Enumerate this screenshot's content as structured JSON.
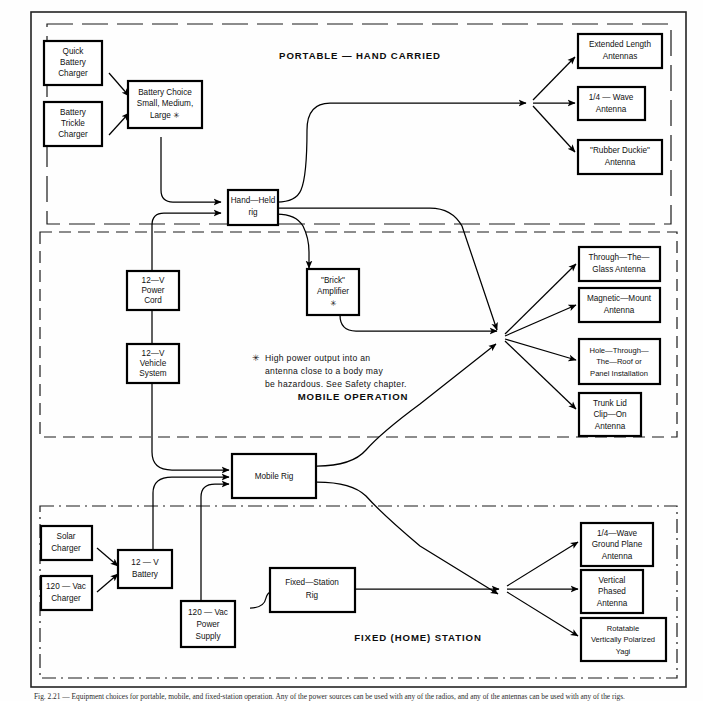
{
  "figure": {
    "caption": "Fig. 2.21 — Equipment choices for portable, mobile, and fixed-station operation. Any of the power sources can be used with any of the radios, and any of the antennas can be used with any of the rigs."
  },
  "sections": [
    {
      "id": "portable",
      "title": "PORTABLE — HAND CARRIED",
      "border_style": "long-dash"
    },
    {
      "id": "mobile",
      "title": "MOBILE OPERATION",
      "border_style": "dashed"
    },
    {
      "id": "fixed",
      "title": "FIXED (HOME) STATION",
      "border_style": "dash-dot"
    }
  ],
  "note": {
    "symbol": "✳",
    "lines": [
      "High power output into an",
      "antenna close to a body may",
      "be hazardous. See Safety chapter."
    ]
  },
  "nodes": {
    "quick_battery_charger": {
      "lines": [
        "Quick",
        "Battery",
        "Charger"
      ]
    },
    "battery_trickle_charger": {
      "lines": [
        "Battery",
        "Trickle",
        "Charger"
      ]
    },
    "battery_choice": {
      "lines": [
        "Battery Choice",
        "Small, Medium,",
        "Large ✳"
      ]
    },
    "hand_held_rig": {
      "lines": [
        "Hand—Held",
        "rig"
      ]
    },
    "extended_length_antennas": {
      "lines": [
        "Extended Length",
        "Antennas"
      ]
    },
    "quarter_wave_antenna": {
      "lines": [
        "1/4 — Wave",
        "Antenna"
      ]
    },
    "rubber_duckie_antenna": {
      "lines": [
        "\"Rubber Duckie\"",
        "Antenna"
      ]
    },
    "power_cord_12v": {
      "lines": [
        "12—V",
        "Power",
        "Cord"
      ]
    },
    "vehicle_system_12v": {
      "lines": [
        "12—V",
        "Vehicle",
        "System"
      ]
    },
    "brick_amplifier": {
      "lines": [
        "\"Brick\"",
        "Amplifier",
        "✳"
      ]
    },
    "through_the_glass_antenna": {
      "lines": [
        "Through—The—",
        "Glass Antenna"
      ]
    },
    "magnetic_mount_antenna": {
      "lines": [
        "Magnetic—Mount",
        "Antenna"
      ]
    },
    "hole_through_roof": {
      "lines": [
        "Hole—Through—",
        "The—Roof or",
        "Panel Installation"
      ]
    },
    "trunk_lid_clip_on": {
      "lines": [
        "Trunk Lid",
        "Clip—On",
        "Antenna"
      ]
    },
    "mobile_rig": {
      "lines": [
        "Mobile Rig"
      ]
    },
    "solar_charger": {
      "lines": [
        "Solar",
        "Charger"
      ]
    },
    "vac_charger_120": {
      "lines": [
        "120 — Vac",
        "Charger"
      ]
    },
    "battery_12v": {
      "lines": [
        "12 — V",
        "Battery"
      ]
    },
    "power_supply_120vac": {
      "lines": [
        "120 — Vac",
        "Power",
        "Supply"
      ]
    },
    "fixed_station_rig": {
      "lines": [
        "Fixed—Station",
        "Rig"
      ]
    },
    "quarter_wave_ground_plane": {
      "lines": [
        "1/4—Wave",
        "Ground Plane",
        "Antenna"
      ]
    },
    "vertical_phased_antenna": {
      "lines": [
        "Vertical",
        "Phased",
        "Antenna"
      ]
    },
    "rotatable_yagi": {
      "lines": [
        "Rotatable",
        "Vertically Polarized",
        "Yagi"
      ]
    }
  },
  "colors": {
    "stroke": "#000000",
    "background": "#ffffff",
    "frame": "#232323"
  }
}
